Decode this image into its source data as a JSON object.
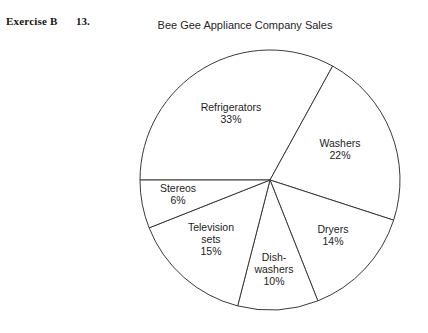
{
  "header": {
    "exercise_label": "Exercise B",
    "exercise_number": "13."
  },
  "chart_data": {
    "type": "pie",
    "title": "Bee Gee Appliance Company Sales",
    "xlabel": "",
    "ylabel": "",
    "legend": "none",
    "grid": false,
    "total": 100,
    "units": "%",
    "start_angle_deg": 180,
    "direction": "clockwise",
    "categories": [
      "Refrigerators",
      "Washers",
      "Dryers",
      "Dish-washers",
      "Television sets",
      "Stereos"
    ],
    "values": [
      33,
      22,
      14,
      10,
      15,
      6
    ],
    "slices": [
      {
        "name": "Refrigerators",
        "name_lines": [
          "Refrigerators"
        ],
        "value": 33,
        "label": "33%",
        "label_x": 231,
        "label_y": 113
      },
      {
        "name": "Washers",
        "name_lines": [
          "Washers"
        ],
        "value": 22,
        "label": "22%",
        "label_x": 340,
        "label_y": 149
      },
      {
        "name": "Dryers",
        "name_lines": [
          "Dryers"
        ],
        "value": 14,
        "label": "14%",
        "label_x": 333,
        "label_y": 235
      },
      {
        "name": "Dish-washers",
        "name_lines": [
          "Dish-",
          "washers"
        ],
        "value": 10,
        "label": "10%",
        "label_x": 274,
        "label_y": 269
      },
      {
        "name": "Television sets",
        "name_lines": [
          "Television",
          "sets"
        ],
        "value": 15,
        "label": "15%",
        "label_x": 211,
        "label_y": 239
      },
      {
        "name": "Stereos",
        "name_lines": [
          "Stereos"
        ],
        "value": 6,
        "label": "6%",
        "label_x": 178,
        "label_y": 194
      }
    ],
    "colors": {
      "slice_fill": "#ffffff",
      "slice_stroke": "#3a3a3a",
      "text": "#1d1d1d",
      "background": "#ffffff"
    }
  }
}
